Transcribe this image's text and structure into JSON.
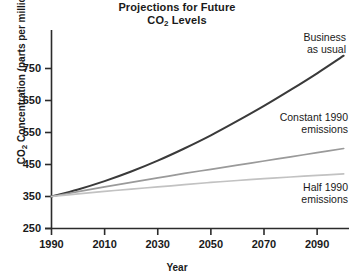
{
  "chart_data": {
    "type": "line",
    "title": "Projections for Future CO2 Levels",
    "title_line1": "Projections for Future",
    "title_line2_pre": "CO",
    "title_line2_sub": "2",
    "title_line2_post": " Levels",
    "xlabel": "Year",
    "ylabel_pre": "CO",
    "ylabel_sub": "2",
    "ylabel_post": " Concentration (parts per million)",
    "ylabel": "CO2 Concentration (parts per million)",
    "x": [
      1990,
      2000,
      2010,
      2020,
      2030,
      2040,
      2050,
      2060,
      2070,
      2080,
      2090,
      2100
    ],
    "xticks": [
      "1990",
      "2010",
      "2030",
      "2050",
      "2070",
      "2090"
    ],
    "xtick_values": [
      1990,
      2010,
      2030,
      2050,
      2070,
      2090
    ],
    "yticks": [
      "250",
      "350",
      "450",
      "550",
      "650",
      "750"
    ],
    "ytick_values": [
      250,
      350,
      450,
      550,
      650,
      750
    ],
    "xlim": [
      1990,
      2102
    ],
    "ylim": [
      250,
      790
    ],
    "grid": false,
    "legend_position": "inline-right",
    "series": [
      {
        "name": "Business as usual",
        "label_line1": "Business",
        "label_line2": "as usual",
        "color": "#3a3a3a",
        "values": [
          350,
          372,
          398,
          428,
          462,
          500,
          541,
          586,
          633,
          683,
          735,
          790
        ]
      },
      {
        "name": "Constant 1990 emissions",
        "label_line1": "Constant 1990",
        "label_line2": "emissions",
        "color": "#9a9a9a",
        "values": [
          350,
          365,
          380,
          394,
          408,
          422,
          435,
          448,
          461,
          474,
          487,
          500
        ]
      },
      {
        "name": "Half 1990 emissions",
        "label_line1": "Half 1990",
        "label_line2": "emissions",
        "color": "#c2c2c2",
        "values": [
          350,
          358,
          366,
          373,
          380,
          387,
          394,
          400,
          406,
          411,
          416,
          421
        ]
      }
    ]
  }
}
